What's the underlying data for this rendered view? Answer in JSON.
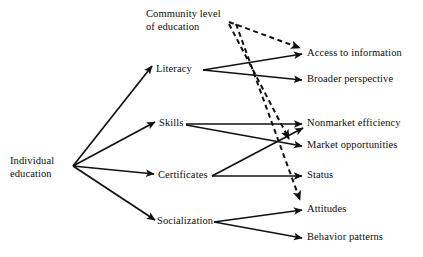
{
  "diagram": {
    "background_color": "#ffffff",
    "stroke_color": "#111111",
    "nodes": {
      "individual_education": "Individual\neducation",
      "community_level": "Community level\nof education",
      "literacy": "Literacy",
      "skills": "Skills",
      "certificates": "Certificates",
      "socialization": "Socialization",
      "access_to_information": "Access to information",
      "broader_perspective": "Broader perspective",
      "nonmarket_efficiency": "Nonmarket efficiency",
      "market_opportunities": "Market opportunities",
      "status": "Status",
      "attitudes": "Attitudes",
      "behavior_patterns": "Behavior patterns"
    },
    "edges": [
      {
        "from": "individual_education",
        "to": "literacy",
        "style": "solid"
      },
      {
        "from": "individual_education",
        "to": "skills",
        "style": "solid"
      },
      {
        "from": "individual_education",
        "to": "certificates",
        "style": "solid"
      },
      {
        "from": "individual_education",
        "to": "socialization",
        "style": "solid"
      },
      {
        "from": "literacy",
        "to": "access_to_information",
        "style": "solid"
      },
      {
        "from": "literacy",
        "to": "broader_perspective",
        "style": "solid"
      },
      {
        "from": "skills",
        "to": "nonmarket_efficiency",
        "style": "solid"
      },
      {
        "from": "skills",
        "to": "market_opportunities",
        "style": "solid"
      },
      {
        "from": "certificates",
        "to": "status",
        "style": "solid"
      },
      {
        "from": "certificates",
        "to": "nonmarket_efficiency",
        "style": "solid"
      },
      {
        "from": "socialization",
        "to": "attitudes",
        "style": "solid"
      },
      {
        "from": "socialization",
        "to": "behavior_patterns",
        "style": "solid"
      },
      {
        "from": "community_level",
        "to": "access_to_information",
        "style": "dashed"
      },
      {
        "from": "community_level",
        "to": "market_opportunities",
        "style": "dashed"
      },
      {
        "from": "community_level",
        "to": "attitudes",
        "style": "dashed"
      }
    ]
  }
}
